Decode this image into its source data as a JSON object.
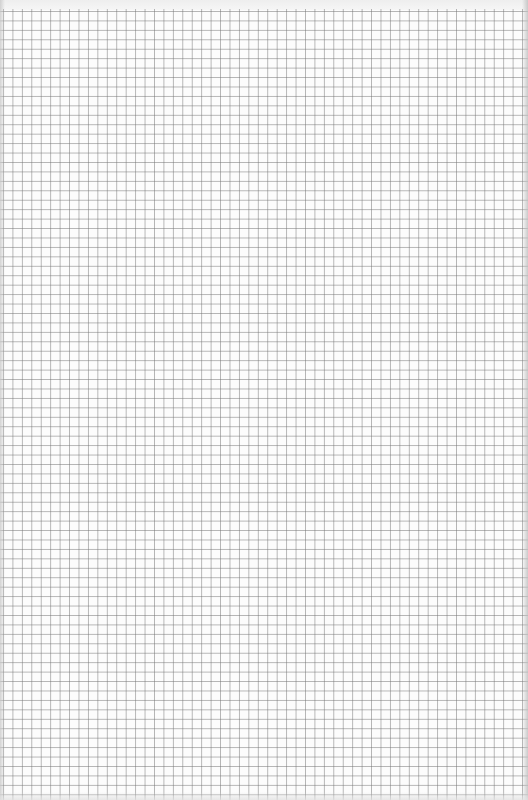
{
  "page": {
    "type": "graph-paper-scan",
    "grid": {
      "cell_size_px": 9.45,
      "line_color": "#9a9a9a",
      "background_color": "#fcfcfc"
    },
    "content": []
  }
}
